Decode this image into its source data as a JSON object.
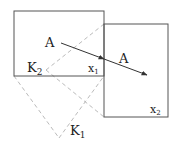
{
  "diagram": {
    "labels": {
      "a_left": "A",
      "a_right": "A",
      "k2": "K",
      "k2_sub": "2",
      "k1": "K",
      "k1_sub": "1",
      "x1": "x",
      "x1_sub": "1",
      "x2": "x",
      "x2_sub": "2"
    },
    "colors": {
      "solid": "#555555",
      "dashed": "#bbbbbb",
      "arrow": "#333333"
    }
  }
}
